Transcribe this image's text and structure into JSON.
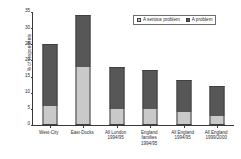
{
  "chart_data": {
    "type": "bar",
    "stacked": true,
    "title": "",
    "subtitle": "",
    "xlabel": "",
    "ylabel": "% of respondents",
    "ylim": [
      0,
      35
    ],
    "yticks": [
      0,
      5,
      10,
      15,
      20,
      25,
      30,
      35
    ],
    "ytick_labels": [
      "0",
      "5",
      "10",
      "15",
      "20",
      "25",
      "30",
      "35"
    ],
    "grid": false,
    "legend_position": "top-right",
    "categories": [
      "West-City",
      "East-Docks",
      "All London 1994/95",
      "England families 1994/95",
      "All England 1994/95",
      "All England 1999/2000"
    ],
    "category_lines": [
      [
        "West-City"
      ],
      [
        "East-Docks"
      ],
      [
        "All London",
        "1994/95"
      ],
      [
        "England",
        "families",
        "1994/95"
      ],
      [
        "All England",
        "1994/95"
      ],
      [
        "All England",
        "1999/2000"
      ]
    ],
    "series": [
      {
        "name": "A serious problem",
        "color": "#c9c9c9",
        "values": [
          6,
          18,
          5,
          5,
          4,
          2.7
        ]
      },
      {
        "name": "A problem",
        "color": "#575757",
        "values": [
          19,
          16,
          13,
          12,
          10,
          9.3
        ]
      }
    ],
    "totals": [
      25,
      34,
      18,
      17,
      14,
      12
    ]
  },
  "legend": {
    "items": [
      {
        "label": "A serious problem",
        "color": "#c9c9c9"
      },
      {
        "label": "A problem",
        "color": "#575757"
      }
    ]
  },
  "colors": {
    "serious": "#c9c9c9",
    "problem": "#575757",
    "axis": "#3a3a3a",
    "text": "#2b2b2b",
    "background": "#ffffff"
  }
}
